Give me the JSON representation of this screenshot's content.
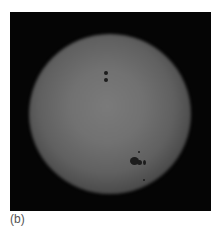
{
  "figure": {
    "caption": "(b)",
    "colors": {
      "background": "#050505",
      "disk_center": "#7a7a7a",
      "spot": "#1c1c1c"
    },
    "sunspots": [
      {
        "x": 94,
        "y": 59,
        "w": 4,
        "h": 4
      },
      {
        "x": 94,
        "y": 66,
        "w": 4,
        "h": 4
      },
      {
        "x": 120,
        "y": 145,
        "w": 9,
        "h": 8
      },
      {
        "x": 127,
        "y": 148,
        "w": 5,
        "h": 5
      },
      {
        "x": 133,
        "y": 148,
        "w": 3,
        "h": 5
      },
      {
        "x": 128,
        "y": 139,
        "w": 2,
        "h": 2
      },
      {
        "x": 133,
        "y": 167,
        "w": 2,
        "h": 2
      }
    ]
  }
}
